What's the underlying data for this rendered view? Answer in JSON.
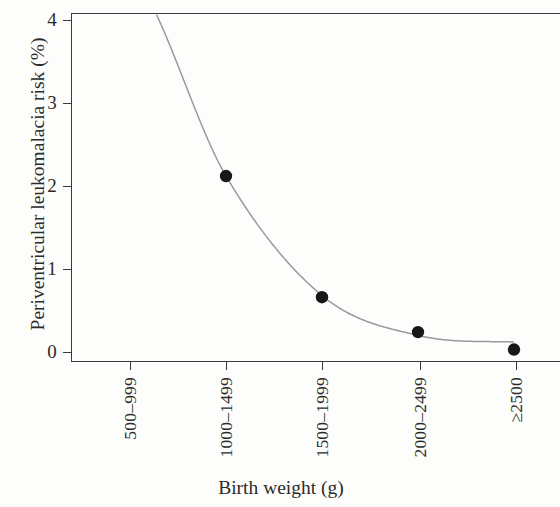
{
  "chart_data": {
    "type": "scatter",
    "title": "",
    "subtitle": "",
    "xlabel": "Birth weight (g)",
    "ylabel": "Periventricular leukomalacia risk (%)",
    "categories": [
      "500–999",
      "1000–1499",
      "1500–1999",
      "2000–2499",
      "≥2500"
    ],
    "series": [
      {
        "name": "Periventricular leukomalacia risk",
        "marker": "filled-circle",
        "color": "#171717",
        "values": [
          null,
          2.12,
          0.66,
          0.24,
          0.03
        ]
      },
      {
        "name": "Fitted curve",
        "type": "line",
        "color": "#9a9a9a",
        "note": "Convex decreasing fit entering the plot at the top border near the 500–999 category, flattening near zero with a shallow minimum of about 0.11 between 2000–2499 and ≥2500",
        "x": [
          "500–999",
          "1000–1499",
          "1500–1999",
          "2000–2499",
          "≥2500"
        ],
        "values": [
          4.6,
          2.12,
          0.68,
          0.2,
          0.12
        ]
      }
    ],
    "ylim": [
      0,
      4.15
    ],
    "yticks": [
      0,
      1,
      2,
      3,
      4
    ],
    "ytick_labels": [
      "0",
      "1",
      "2",
      "3",
      "4"
    ],
    "xtick_labels": [
      "500–999",
      "1000–1499",
      "1500–1999",
      "2000–2499",
      "≥2500"
    ],
    "grid": false,
    "legend": null,
    "legend_position": "none",
    "annotations": [],
    "axis_color": "#3a3a3a",
    "background_color": "#fdfdfb"
  }
}
